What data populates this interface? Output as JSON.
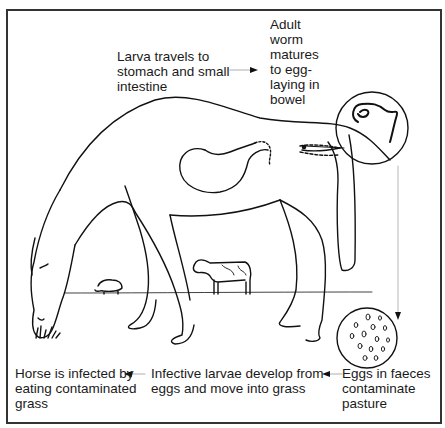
{
  "diagram": {
    "type": "life-cycle",
    "steps": [
      {
        "id": "larva-travels",
        "text": "Larva travels to\nstomach and small\nintestine"
      },
      {
        "id": "adult-worm",
        "text": "Adult\nworm\nmatures\nto egg-\nlaying in\nbowel"
      },
      {
        "id": "eggs-in-faeces",
        "text": "Eggs in faeces\ncontaminate\npasture"
      },
      {
        "id": "infective-larvae",
        "text": "Infective larvae develop from\neggs and move into grass"
      },
      {
        "id": "horse-infected",
        "text": "Horse is infected by\neating contaminated\ngrass"
      }
    ],
    "illustrations": [
      "grazing horse",
      "stomach with intestine",
      "magnified worm circle",
      "magnified egg circle",
      "cow",
      "sheep",
      "grass tuft"
    ],
    "colors": {
      "line": "#111111",
      "frame": "#333333",
      "background": "#ffffff"
    }
  }
}
